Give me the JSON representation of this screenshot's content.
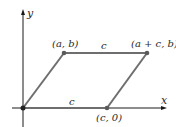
{
  "diagram": {
    "type": "parallelogram-on-axes",
    "axes": {
      "x_label": "x",
      "y_label": "y"
    },
    "vertices": [
      {
        "name": "origin",
        "label": ""
      },
      {
        "name": "a-b",
        "label": "(a, b)"
      },
      {
        "name": "a-plus-c-b",
        "label": "(a + c, b)"
      },
      {
        "name": "c-0",
        "label": "(c, 0)"
      }
    ],
    "edge_labels": {
      "top": "c",
      "bottom": "c"
    },
    "colors": {
      "axis": "#1a1a1a",
      "edge": "#6e6e6e",
      "point": "#5a5a5a"
    }
  }
}
